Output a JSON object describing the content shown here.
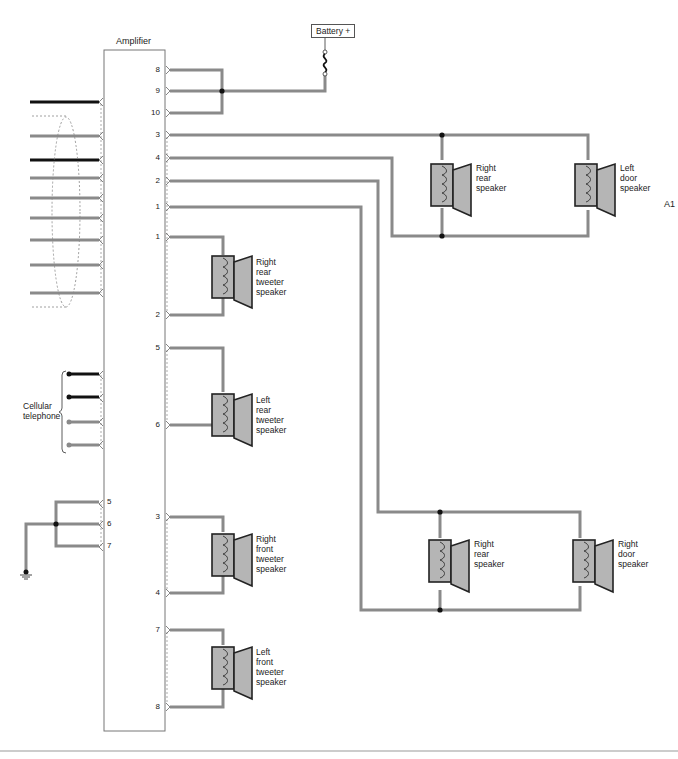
{
  "diagram": {
    "title": "Amplifier",
    "id_label": "A1",
    "power": {
      "label": "Battery +"
    },
    "cellular": {
      "label": "Cellular\ntelephone"
    },
    "colors": {
      "wire": "#8a8a8a",
      "wire_dark": "#111111",
      "speaker_fill": "#b5b5b5",
      "outline": "#222222"
    },
    "amplifier_right_pins": [
      "8",
      "9",
      "10",
      "3",
      "4",
      "2",
      "1",
      "1",
      "2",
      "5",
      "6",
      "3",
      "4",
      "7",
      "8"
    ],
    "amplifier_left_ground_pins": [
      "5",
      "6",
      "7"
    ],
    "speakers": [
      {
        "label": "Right\nrear\nspeaker"
      },
      {
        "label": "Left\ndoor\nspeaker"
      },
      {
        "label": "Right\nrear\ntweeter\nspeaker"
      },
      {
        "label": "Left\nrear\ntweeter\nspeaker"
      },
      {
        "label": "Right\nfront\ntweeter\nspeaker"
      },
      {
        "label": "Left\nfront\ntweeter\nspeaker"
      },
      {
        "label": "Right\nrear\nspeaker"
      },
      {
        "label": "Right\ndoor\nspeaker"
      }
    ]
  }
}
